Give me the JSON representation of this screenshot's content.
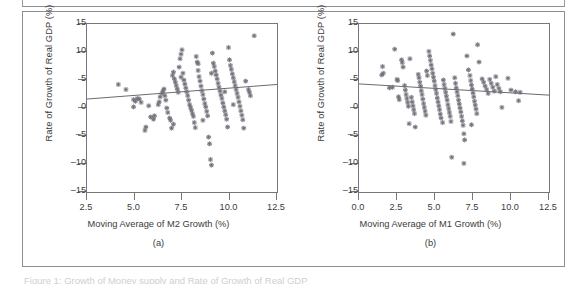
{
  "figure": {
    "panels": [
      {
        "tag": "(a)",
        "xlabel": "Moving Average of M2 Growth (%)",
        "ylabel": "Rate of Growth of Real GDP (%)"
      },
      {
        "tag": "(b)",
        "xlabel": "Moving Average of M1 Growth (%)",
        "ylabel": "Rate of Growth of Real GDP (%)"
      }
    ],
    "caption": "Figure 1: Growth of Money supply and Rate of Growth of Real GDP"
  },
  "colors": {
    "frame": "#8e8e8e",
    "axis": "#777777",
    "marker": "#6f6f7a",
    "fitline": "#6b6b6b",
    "text": "#3b3b3b",
    "background": "#ffffff"
  },
  "chart_data": [
    {
      "type": "scatter",
      "title": "(a)",
      "xlabel": "Moving Average of M2 Growth (%)",
      "ylabel": "Rate of Growth of Real GDP (%)",
      "xlim": [
        2.5,
        12.5
      ],
      "ylim": [
        -15,
        15
      ],
      "xticks": [
        "2.5",
        "5.0",
        "7.5",
        "10.0",
        "12.5"
      ],
      "xtickvals": [
        2.5,
        5.0,
        7.5,
        10.0,
        12.5
      ],
      "yticks": [
        "15",
        "10",
        "5",
        "0",
        "-5",
        "-10",
        "-15"
      ],
      "ytickvals": [
        15,
        10,
        5,
        0,
        -5,
        -10,
        -15
      ],
      "grid": false,
      "legend": null,
      "marker": "star",
      "trendline": {
        "x": [
          2.5,
          12.5
        ],
        "y": [
          1.6,
          4.2
        ],
        "slope": 0.26,
        "intercept": 0.95
      },
      "points": [
        [
          4.15,
          4.2
        ],
        [
          4.55,
          3.3
        ],
        [
          4.95,
          1.5
        ],
        [
          5.05,
          1.2
        ],
        [
          4.95,
          0.2
        ],
        [
          5.15,
          1.7
        ],
        [
          5.25,
          1.6
        ],
        [
          5.75,
          0.4
        ],
        [
          5.85,
          -1.6
        ],
        [
          6.0,
          -2.0
        ],
        [
          5.6,
          -3.4
        ],
        [
          5.55,
          -4.0
        ],
        [
          6.05,
          -1.4
        ],
        [
          6.3,
          1.1
        ],
        [
          6.35,
          2.0
        ],
        [
          6.45,
          2.6
        ],
        [
          6.5,
          3.0
        ],
        [
          6.55,
          3.4
        ],
        [
          6.6,
          2.2
        ],
        [
          6.65,
          1.4
        ],
        [
          6.7,
          0.0
        ],
        [
          6.75,
          -0.8
        ],
        [
          6.85,
          -1.8
        ],
        [
          6.9,
          -2.2
        ],
        [
          6.95,
          -3.6
        ],
        [
          7.0,
          5.8
        ],
        [
          7.05,
          6.4
        ],
        [
          7.1,
          5.2
        ],
        [
          7.15,
          4.6
        ],
        [
          7.2,
          4.0
        ],
        [
          7.25,
          3.4
        ],
        [
          7.3,
          2.8
        ],
        [
          7.35,
          7.3
        ],
        [
          7.4,
          8.8
        ],
        [
          7.45,
          9.6
        ],
        [
          7.5,
          10.4
        ],
        [
          7.55,
          6.2
        ],
        [
          7.6,
          5.0
        ],
        [
          7.65,
          4.3
        ],
        [
          7.7,
          3.6
        ],
        [
          7.75,
          2.9
        ],
        [
          7.8,
          2.2
        ],
        [
          7.85,
          1.4
        ],
        [
          7.9,
          0.6
        ],
        [
          7.95,
          0.1
        ],
        [
          8.0,
          -0.4
        ],
        [
          8.05,
          -1.0
        ],
        [
          8.1,
          -1.5
        ],
        [
          8.15,
          -2.6
        ],
        [
          8.2,
          -3.5
        ],
        [
          8.25,
          9.2
        ],
        [
          8.3,
          8.2
        ],
        [
          8.35,
          6.7
        ],
        [
          8.4,
          5.6
        ],
        [
          8.45,
          4.8
        ],
        [
          8.5,
          3.9
        ],
        [
          8.55,
          3.1
        ],
        [
          8.6,
          2.4
        ],
        [
          8.65,
          1.6
        ],
        [
          8.7,
          0.8
        ],
        [
          8.75,
          0.2
        ],
        [
          8.8,
          -0.6
        ],
        [
          8.85,
          -1.4
        ],
        [
          8.9,
          -5.2
        ],
        [
          8.95,
          -6.4
        ],
        [
          9.0,
          -9.2
        ],
        [
          9.05,
          -10.2
        ],
        [
          9.1,
          9.8
        ],
        [
          9.15,
          8.0
        ],
        [
          9.2,
          7.4
        ],
        [
          9.25,
          6.6
        ],
        [
          9.3,
          5.9
        ],
        [
          9.35,
          5.2
        ],
        [
          9.4,
          4.4
        ],
        [
          9.45,
          3.7
        ],
        [
          9.5,
          3.0
        ],
        [
          9.55,
          2.3
        ],
        [
          9.6,
          1.7
        ],
        [
          9.65,
          0.9
        ],
        [
          9.7,
          0.2
        ],
        [
          9.75,
          -0.5
        ],
        [
          9.8,
          -1.2
        ],
        [
          9.85,
          -2.0
        ],
        [
          9.9,
          -3.4
        ],
        [
          9.95,
          10.8
        ],
        [
          10.0,
          8.6
        ],
        [
          10.05,
          7.6
        ],
        [
          10.1,
          6.9
        ],
        [
          10.15,
          6.1
        ],
        [
          10.2,
          5.4
        ],
        [
          10.25,
          4.7
        ],
        [
          10.3,
          4.0
        ],
        [
          10.35,
          3.3
        ],
        [
          10.4,
          2.6
        ],
        [
          10.45,
          1.9
        ],
        [
          10.5,
          1.1
        ],
        [
          10.55,
          0.3
        ],
        [
          10.6,
          -0.5
        ],
        [
          10.65,
          -1.3
        ],
        [
          10.7,
          -2.1
        ],
        [
          10.75,
          -3.6
        ],
        [
          10.85,
          4.8
        ],
        [
          11.0,
          3.3
        ],
        [
          11.05,
          2.8
        ],
        [
          11.1,
          2.2
        ],
        [
          11.3,
          12.9
        ],
        [
          7.45,
          5.5
        ],
        [
          8.35,
          7.9
        ],
        [
          9.05,
          6.2
        ],
        [
          6.25,
          0.6
        ],
        [
          5.35,
          1.0
        ],
        [
          8.6,
          -2.2
        ],
        [
          7.05,
          -2.9
        ],
        [
          9.75,
          2.9
        ],
        [
          10.2,
          0.6
        ]
      ]
    },
    {
      "type": "scatter",
      "title": "(b)",
      "xlabel": "Moving Average of M1 Growth (%)",
      "ylabel": "Rate of Growth of Real GDP (%)",
      "xlim": [
        0.0,
        12.5
      ],
      "ylim": [
        -15,
        15
      ],
      "xticks": [
        "0.0",
        "2.5",
        "5.0",
        "7.5",
        "10.0",
        "12.5"
      ],
      "xtickvals": [
        0.0,
        2.5,
        5.0,
        7.5,
        10.0,
        12.5
      ],
      "yticks": [
        "15",
        "10",
        "5",
        "0",
        "-5",
        "-10",
        "-15"
      ],
      "ytickvals": [
        15,
        10,
        5,
        0,
        -5,
        -10,
        -15
      ],
      "grid": false,
      "legend": null,
      "marker": "star",
      "trendline": {
        "x": [
          0.0,
          12.5
        ],
        "y": [
          4.3,
          2.3
        ],
        "slope": -0.16,
        "intercept": 4.3
      },
      "points": [
        [
          1.55,
          7.4
        ],
        [
          1.5,
          5.9
        ],
        [
          1.6,
          6.2
        ],
        [
          2.0,
          3.6
        ],
        [
          2.2,
          3.7
        ],
        [
          2.35,
          10.5
        ],
        [
          2.5,
          5.1
        ],
        [
          2.55,
          4.9
        ],
        [
          2.6,
          2.0
        ],
        [
          2.65,
          1.5
        ],
        [
          2.8,
          8.6
        ],
        [
          2.85,
          8.1
        ],
        [
          2.9,
          7.3
        ],
        [
          3.0,
          4.0
        ],
        [
          3.05,
          3.2
        ],
        [
          3.1,
          2.4
        ],
        [
          3.15,
          1.7
        ],
        [
          3.2,
          1.0
        ],
        [
          3.25,
          0.3
        ],
        [
          3.3,
          -2.8
        ],
        [
          3.35,
          8.8
        ],
        [
          3.45,
          1.9
        ],
        [
          3.5,
          1.1
        ],
        [
          3.55,
          0.4
        ],
        [
          3.6,
          -0.3
        ],
        [
          3.65,
          -1.0
        ],
        [
          3.7,
          -3.4
        ],
        [
          3.9,
          6.0
        ],
        [
          3.95,
          5.4
        ],
        [
          4.0,
          4.6
        ],
        [
          4.05,
          3.9
        ],
        [
          4.1,
          3.1
        ],
        [
          4.15,
          2.4
        ],
        [
          4.2,
          1.6
        ],
        [
          4.25,
          0.8
        ],
        [
          4.3,
          0.1
        ],
        [
          4.35,
          -0.6
        ],
        [
          4.4,
          -1.3
        ],
        [
          4.45,
          6.6
        ],
        [
          4.5,
          5.8
        ],
        [
          4.6,
          10.1
        ],
        [
          4.65,
          9.3
        ],
        [
          4.7,
          8.5
        ],
        [
          4.75,
          7.7
        ],
        [
          4.8,
          7.0
        ],
        [
          4.85,
          6.2
        ],
        [
          4.9,
          5.5
        ],
        [
          4.95,
          4.8
        ],
        [
          5.0,
          4.0
        ],
        [
          5.05,
          3.3
        ],
        [
          5.1,
          2.6
        ],
        [
          5.15,
          1.8
        ],
        [
          5.2,
          1.1
        ],
        [
          5.25,
          0.4
        ],
        [
          5.3,
          -0.3
        ],
        [
          5.35,
          -1.1
        ],
        [
          5.4,
          -1.8
        ],
        [
          5.5,
          -2.6
        ],
        [
          5.55,
          5.0
        ],
        [
          5.6,
          4.2
        ],
        [
          5.65,
          3.5
        ],
        [
          5.7,
          2.8
        ],
        [
          5.75,
          2.1
        ],
        [
          5.8,
          1.4
        ],
        [
          5.85,
          0.6
        ],
        [
          5.9,
          -0.1
        ],
        [
          5.95,
          -0.8
        ],
        [
          6.0,
          -1.5
        ],
        [
          6.05,
          -2.4
        ],
        [
          6.1,
          -8.8
        ],
        [
          6.2,
          13.2
        ],
        [
          6.3,
          5.4
        ],
        [
          6.35,
          4.4
        ],
        [
          6.4,
          3.6
        ],
        [
          6.45,
          2.9
        ],
        [
          6.5,
          2.2
        ],
        [
          6.55,
          1.4
        ],
        [
          6.6,
          0.7
        ],
        [
          6.65,
          0.0
        ],
        [
          6.7,
          -0.7
        ],
        [
          6.75,
          -1.5
        ],
        [
          6.8,
          -2.3
        ],
        [
          6.85,
          -3.1
        ],
        [
          6.9,
          -4.6
        ],
        [
          6.95,
          -5.7
        ],
        [
          6.9,
          -9.9
        ],
        [
          7.1,
          9.3
        ],
        [
          7.2,
          6.8
        ],
        [
          7.3,
          5.8
        ],
        [
          7.35,
          4.9
        ],
        [
          7.4,
          4.1
        ],
        [
          7.45,
          3.4
        ],
        [
          7.5,
          2.7
        ],
        [
          7.55,
          2.0
        ],
        [
          7.6,
          1.2
        ],
        [
          7.65,
          0.5
        ],
        [
          7.7,
          -0.2
        ],
        [
          7.75,
          -1.0
        ],
        [
          7.8,
          11.3
        ],
        [
          7.9,
          8.2
        ],
        [
          8.1,
          5.2
        ],
        [
          8.2,
          4.6
        ],
        [
          8.3,
          3.9
        ],
        [
          8.4,
          3.3
        ],
        [
          8.5,
          2.6
        ],
        [
          8.6,
          5.1
        ],
        [
          8.7,
          4.4
        ],
        [
          8.8,
          3.7
        ],
        [
          8.9,
          3.0
        ],
        [
          9.0,
          5.6
        ],
        [
          9.1,
          4.2
        ],
        [
          9.2,
          3.5
        ],
        [
          9.3,
          2.9
        ],
        [
          9.4,
          0.1
        ],
        [
          9.8,
          5.3
        ],
        [
          10.0,
          3.2
        ],
        [
          10.3,
          2.9
        ],
        [
          10.5,
          1.3
        ],
        [
          10.6,
          2.8
        ],
        [
          7.4,
          -3.0
        ]
      ]
    }
  ]
}
